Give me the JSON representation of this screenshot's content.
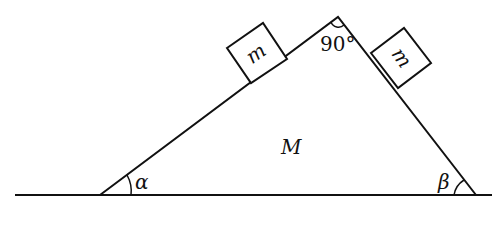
{
  "diagram": {
    "wedge_label": "M",
    "block_left_label": "m",
    "block_right_label": "m",
    "apex_angle_label": "90°",
    "left_angle_label": "α",
    "right_angle_label": "β",
    "line_color": "#111111"
  }
}
